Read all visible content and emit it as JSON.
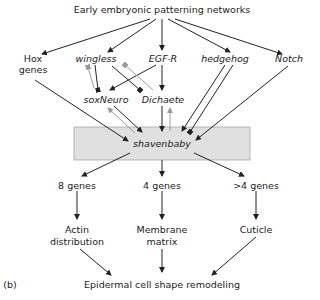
{
  "diagram": {
    "top": "Early embryonic patterning networks",
    "inputs": {
      "hox_line1": "Hox",
      "hox_line2": "genes",
      "wingless": "wingless",
      "egfr": "EGF-R",
      "hedgehog": "hedgehog",
      "notch": "Notch"
    },
    "intermediates": {
      "soxneuro": "soxNeuro",
      "dichaete": "Dichaete"
    },
    "hub": "shavenbaby",
    "gene_sets": {
      "left": "8 genes",
      "middle": "4 genes",
      "right": ">4 genes"
    },
    "functions": {
      "actin_line1": "Actin",
      "actin_line2": "distribution",
      "membrane_line1": "Membrane",
      "membrane_line2": "matrix",
      "cuticle": "Cuticle"
    },
    "bottom": "Epidermal cell shape remodeling",
    "panel_label": "(b)",
    "colors": {
      "line": "#222222",
      "feedback": "#9a9a9a",
      "hub_fill": "#e0e0e0",
      "hub_stroke": "#a8a8a8"
    }
  }
}
